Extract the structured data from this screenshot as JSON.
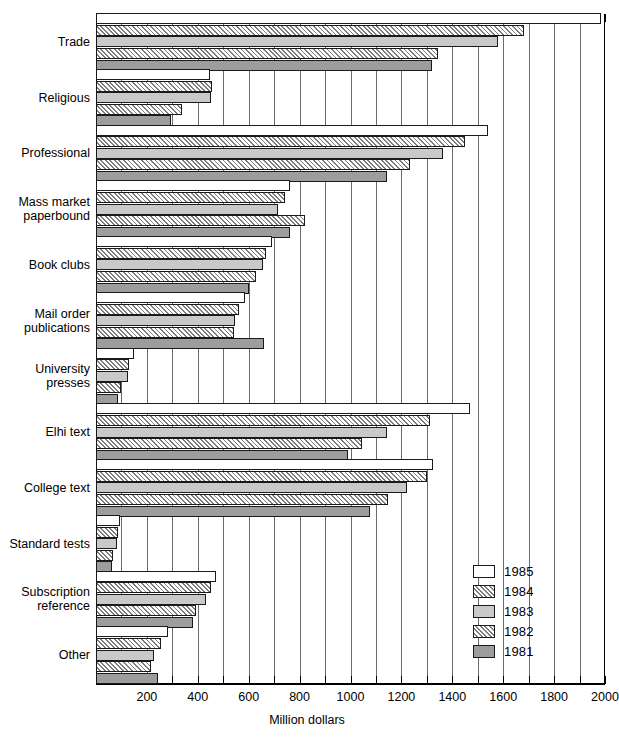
{
  "chart_data": {
    "type": "bar",
    "orientation": "horizontal",
    "title": "",
    "xlabel": "Million dollars",
    "ylabel": "",
    "xlim": [
      0,
      2000
    ],
    "xticks": [
      0,
      200,
      400,
      600,
      800,
      1000,
      1200,
      1400,
      1600,
      1800,
      2000
    ],
    "xtick_labels": [
      "",
      "200",
      "400",
      "600",
      "800",
      "1000",
      "1200",
      "1400",
      "1600",
      "1800",
      "2000"
    ],
    "minor_tick_step": 100,
    "grid": "vertical",
    "legend_position": "lower-right",
    "categories": [
      "Trade",
      "Religious",
      "Professional",
      "Mass market\npaperbound",
      "Book clubs",
      "Mail order\npublications",
      "University\npresses",
      "Elhi text",
      "College text",
      "Standard tests",
      "Subscription\nreference",
      "Other"
    ],
    "series": [
      {
        "name": "1985",
        "values": [
          1985,
          448,
          1540,
          762,
          690,
          585,
          150,
          1470,
          1324,
          94,
          471,
          283
        ]
      },
      {
        "name": "1984",
        "values": [
          1683,
          456,
          1450,
          743,
          668,
          560,
          130,
          1312,
          1300,
          86,
          452,
          255
        ]
      },
      {
        "name": "1983",
        "values": [
          1580,
          452,
          1364,
          715,
          655,
          548,
          125,
          1143,
          1222,
          82,
          432,
          228
        ]
      },
      {
        "name": "1982",
        "values": [
          1345,
          336,
          1234,
          821,
          628,
          543,
          98,
          1045,
          1147,
          66,
          393,
          216
        ]
      },
      {
        "name": "1981",
        "values": [
          1320,
          294,
          1143,
          762,
          600,
          660,
          86,
          991,
          1077,
          63,
          381,
          244
        ]
      }
    ],
    "series_colors": {
      "1985": "#ffffff",
      "1984": "#e2e2e2",
      "1983": "#c9c9c9",
      "1982": "#ffffff",
      "1981": "#9d9d9d"
    },
    "series_patterns": {
      "1985": "solid",
      "1984": "hatched",
      "1983": "solid",
      "1982": "hatched",
      "1981": "solid"
    }
  },
  "legend": {
    "entries": [
      "1985",
      "1984",
      "1983",
      "1982",
      "1981"
    ]
  }
}
